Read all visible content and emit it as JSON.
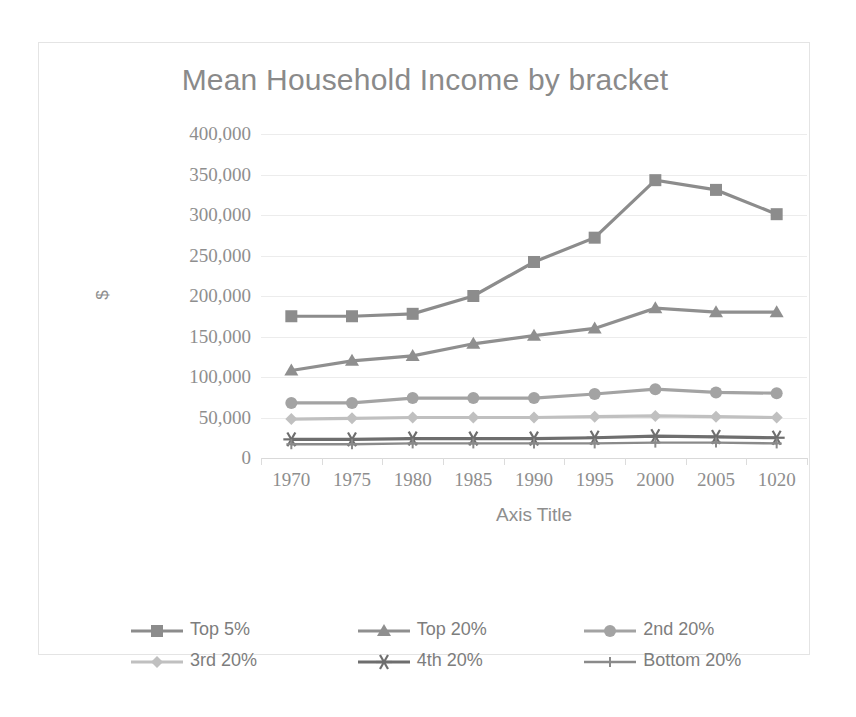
{
  "chart_data": {
    "type": "line",
    "title": "Mean Household Income by bracket",
    "xlabel": "Axis Title",
    "ylabel": "$",
    "ylim": [
      0,
      400000
    ],
    "ytick_labels": [
      "400,000",
      "350,000",
      "300,000",
      "250,000",
      "200,000",
      "150,000",
      "100,000",
      "50,000",
      "0"
    ],
    "ytick_values": [
      400000,
      350000,
      300000,
      250000,
      200000,
      150000,
      100000,
      50000,
      0
    ],
    "grid": true,
    "legend_position": "bottom",
    "categories": [
      "1970",
      "1975",
      "1980",
      "1985",
      "1990",
      "1995",
      "2000",
      "2005",
      "1020"
    ],
    "series": [
      {
        "name": "Top 5%",
        "marker": "square",
        "color": "#8c8c8c",
        "values": [
          175000,
          175000,
          178000,
          200000,
          242000,
          272000,
          343000,
          331000,
          301000
        ]
      },
      {
        "name": "Top 20%",
        "marker": "triangle",
        "color": "#8f8f8f",
        "values": [
          108000,
          120000,
          126000,
          141000,
          151000,
          160000,
          185000,
          180000,
          180000
        ]
      },
      {
        "name": "2nd 20%",
        "marker": "circle",
        "color": "#a3a3a3",
        "values": [
          68000,
          68000,
          74000,
          74000,
          74000,
          79000,
          85000,
          81000,
          80000
        ]
      },
      {
        "name": "3rd 20%",
        "marker": "diamond",
        "color": "#c0c0c0",
        "values": [
          48000,
          49000,
          50000,
          50000,
          50000,
          51000,
          52000,
          51000,
          50000
        ]
      },
      {
        "name": "4th 20%",
        "marker": "star",
        "color": "#6e6e6e",
        "values": [
          23000,
          23000,
          24000,
          24000,
          24000,
          25000,
          27000,
          26000,
          25000
        ]
      },
      {
        "name": "Bottom 20%",
        "marker": "plus",
        "color": "#8a8a8a",
        "values": [
          17000,
          17000,
          18000,
          18000,
          18000,
          18000,
          19000,
          19000,
          18000
        ]
      }
    ]
  }
}
